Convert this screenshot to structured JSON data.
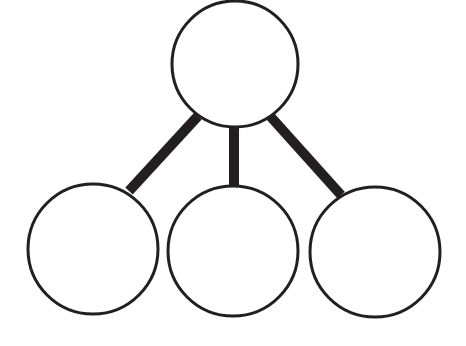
{
  "diagram": {
    "type": "tree",
    "width": 466,
    "height": 346,
    "background": "#ffffff",
    "stroke_color": "#231f20",
    "connector_color": "#231f20",
    "root": {
      "id": "root",
      "cx": 235,
      "cy": 64,
      "r": 63,
      "label": ""
    },
    "children": [
      {
        "id": "child-left",
        "cx": 93,
        "cy": 249,
        "r": 65,
        "label": ""
      },
      {
        "id": "child-middle",
        "cx": 233,
        "cy": 251,
        "r": 65,
        "label": ""
      },
      {
        "id": "child-right",
        "cx": 375,
        "cy": 252,
        "r": 65,
        "label": ""
      }
    ],
    "connectors": [
      {
        "from": "root",
        "to": "child-left",
        "x1": 198,
        "y1": 116,
        "x2": 129,
        "y2": 191,
        "width": 10
      },
      {
        "from": "root",
        "to": "child-middle",
        "x1": 234,
        "y1": 126,
        "x2": 234,
        "y2": 186,
        "width": 10
      },
      {
        "from": "root",
        "to": "child-right",
        "x1": 270,
        "y1": 116,
        "x2": 341,
        "y2": 195,
        "width": 10
      }
    ]
  }
}
